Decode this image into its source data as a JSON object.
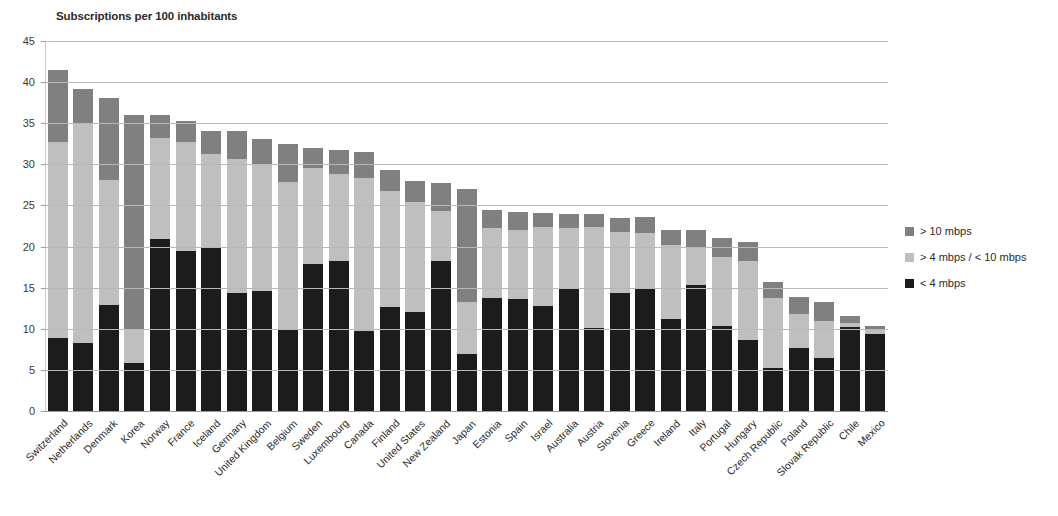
{
  "chart_data": {
    "type": "bar",
    "subtype": "stacked-vertical",
    "title": "Subscriptions per 100 inhabitants",
    "xlabel": "",
    "ylabel": "",
    "ylim": [
      0,
      45
    ],
    "ytick_step": 5,
    "yticks": [
      0,
      5,
      10,
      15,
      20,
      25,
      30,
      35,
      40,
      45
    ],
    "grid": true,
    "legend_position": "right",
    "categories": [
      "Switzerland",
      "Netherlands",
      "Denmark",
      "Korea",
      "Norway",
      "France",
      "Iceland",
      "Germany",
      "United Kingdom",
      "Belgium",
      "Sweden",
      "Luxembourg",
      "Canada",
      "Finland",
      "United States",
      "New Zealand",
      "Japan",
      "Estonia",
      "Spain",
      "Israel",
      "Australia",
      "Austria",
      "Slovenia",
      "Greece",
      "Ireland",
      "Italy",
      "Portugal",
      "Hungary",
      "Czech Republic",
      "Poland",
      "Slovak Republic",
      "Chile",
      "Mexico"
    ],
    "series": [
      {
        "name": "< 4 mbps",
        "color": "#1c1c1c",
        "values": [
          8.9,
          8.3,
          12.9,
          5.8,
          20.9,
          19.5,
          19.8,
          14.4,
          14.6,
          9.9,
          17.9,
          18.3,
          9.7,
          12.7,
          12.0,
          18.2,
          6.9,
          13.7,
          13.6,
          12.8,
          14.8,
          10.1,
          14.3,
          15.0,
          11.2,
          15.3,
          10.4,
          8.6,
          5.2,
          7.7,
          6.4,
          10.2,
          9.4
        ]
      },
      {
        "name": "> 4 mbps / < 10 mbps",
        "color": "#bfbfbf",
        "values": [
          23.8,
          26.6,
          15.2,
          4.0,
          12.3,
          13.2,
          11.5,
          16.3,
          15.5,
          18.0,
          11.6,
          10.5,
          18.6,
          14.0,
          13.4,
          6.1,
          6.3,
          8.5,
          8.4,
          9.6,
          7.5,
          12.3,
          7.5,
          6.7,
          9.0,
          4.6,
          8.3,
          9.7,
          8.6,
          4.1,
          4.6,
          0.5,
          0.6
        ]
      },
      {
        "name": "> 10 mbps",
        "color": "#808080",
        "values": [
          8.8,
          4.3,
          10.0,
          26.2,
          2.8,
          2.6,
          2.8,
          3.4,
          3.0,
          4.6,
          2.5,
          3.0,
          3.2,
          2.6,
          2.6,
          3.4,
          13.8,
          2.3,
          2.2,
          1.7,
          1.7,
          1.6,
          1.7,
          1.9,
          1.8,
          2.1,
          2.3,
          2.2,
          1.9,
          2.1,
          2.3,
          0.8,
          0.4
        ]
      }
    ],
    "totals": [
      41.5,
      39.2,
      38.1,
      36.0,
      36.0,
      35.3,
      34.1,
      34.1,
      33.1,
      32.5,
      32.0,
      31.8,
      31.5,
      29.3,
      28.0,
      27.7,
      27.0,
      24.5,
      24.2,
      24.1,
      24.0,
      24.0,
      23.5,
      23.6,
      22.0,
      22.0,
      21.0,
      20.5,
      15.7,
      13.9,
      13.3,
      11.5,
      10.4
    ]
  },
  "legend": {
    "items": [
      {
        "label": "> 10 mbps",
        "color": "#808080"
      },
      {
        "label": "> 4 mbps / < 10 mbps",
        "color": "#bfbfbf"
      },
      {
        "label": "< 4 mbps",
        "color": "#1c1c1c"
      }
    ]
  }
}
